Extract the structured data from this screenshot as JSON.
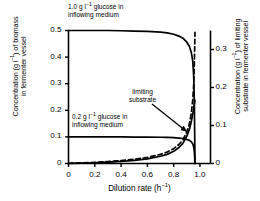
{
  "chart_data": {
    "type": "line",
    "title": "",
    "xlabel": "Dilution rate (h⁻¹)",
    "ylabel_left": "Concentration (g l⁻¹) of biomass in fermenter vessel",
    "ylabel_right": "Concentration (g l⁻¹) of limiting substrate in fermenter vessel",
    "xlim": [
      0,
      1.08
    ],
    "ylim_left": [
      0,
      0.5
    ],
    "ylim_right": [
      0,
      0.35
    ],
    "xticks": [
      "0",
      "0.2",
      "0.4",
      "0.6",
      "0.8",
      "1.0"
    ],
    "xtick_values": [
      0,
      0.2,
      0.4,
      0.6,
      0.8,
      1.0
    ],
    "yticks_left": [
      "0",
      "0.1",
      "0.2",
      "0.3",
      "0.4",
      "0.5"
    ],
    "ytick_values_left": [
      0,
      0.1,
      0.2,
      0.3,
      0.4,
      0.5
    ],
    "yticks_right": [
      "0",
      "0.1",
      "0.2",
      "0.3"
    ],
    "ytick_values_right": [
      0,
      0.1,
      0.2,
      0.3
    ],
    "grid": false,
    "legend": "none",
    "series": [
      {
        "name": "biomass, 1.0 g/l feed",
        "style": "solid",
        "axis": "left",
        "x": [
          0,
          0.1,
          0.2,
          0.3,
          0.4,
          0.5,
          0.6,
          0.7,
          0.75,
          0.8,
          0.84,
          0.87,
          0.9,
          0.92,
          0.935,
          0.945,
          0.952,
          0.957,
          0.96,
          0.962
        ],
        "y": [
          0.5,
          0.5,
          0.5,
          0.5,
          0.499,
          0.498,
          0.497,
          0.494,
          0.491,
          0.486,
          0.479,
          0.471,
          0.456,
          0.44,
          0.415,
          0.385,
          0.33,
          0.23,
          0.1,
          0
        ]
      },
      {
        "name": "biomass, 0.2 g/l feed",
        "style": "solid",
        "axis": "left",
        "x": [
          0,
          0.1,
          0.2,
          0.3,
          0.4,
          0.5,
          0.6,
          0.7,
          0.75,
          0.8,
          0.84,
          0.87,
          0.9,
          0.92,
          0.935,
          0.945,
          0.952,
          0.957,
          0.96,
          0.962
        ],
        "y": [
          0.1,
          0.1,
          0.1,
          0.1,
          0.0998,
          0.0995,
          0.0992,
          0.0986,
          0.098,
          0.097,
          0.0955,
          0.094,
          0.0905,
          0.087,
          0.081,
          0.074,
          0.063,
          0.044,
          0.02,
          0
        ]
      },
      {
        "name": "limiting substrate, 1.0 g/l feed",
        "style": "dashed",
        "axis": "right",
        "x": [
          0,
          0.1,
          0.2,
          0.3,
          0.4,
          0.5,
          0.6,
          0.7,
          0.75,
          0.8,
          0.84,
          0.87,
          0.9,
          0.92,
          0.935,
          0.945,
          0.952,
          0.957,
          0.96,
          0.962
        ],
        "y": [
          0.0005,
          0.0015,
          0.003,
          0.005,
          0.0075,
          0.011,
          0.016,
          0.024,
          0.03,
          0.039,
          0.05,
          0.062,
          0.083,
          0.105,
          0.135,
          0.168,
          0.205,
          0.26,
          0.31,
          0.345
        ]
      },
      {
        "name": "limiting substrate, 0.2 g/l feed",
        "style": "solid",
        "axis": "right",
        "x": [
          0,
          0.1,
          0.2,
          0.3,
          0.4,
          0.5,
          0.6,
          0.7,
          0.75,
          0.8,
          0.84,
          0.87,
          0.9,
          0.92,
          0.935,
          0.945,
          0.952,
          0.957,
          0.96,
          0.962
        ],
        "y": [
          0.0003,
          0.001,
          0.002,
          0.0035,
          0.0055,
          0.008,
          0.012,
          0.019,
          0.024,
          0.032,
          0.042,
          0.053,
          0.072,
          0.09,
          0.112,
          0.13,
          0.145,
          0.156,
          0.162,
          0.166
        ]
      }
    ],
    "annotations": [
      {
        "name": "feed-1.0-label",
        "line1": "1.0 g l⁻¹ glucose in",
        "line2": "inflowing medium"
      },
      {
        "name": "feed-0.2-label",
        "line1": "0.2 g l⁻¹ glucose in",
        "line2": "inflowing medium"
      },
      {
        "name": "limiting-substrate-label",
        "line1": "limiting",
        "line2": "substrate",
        "arrow": true
      }
    ]
  }
}
